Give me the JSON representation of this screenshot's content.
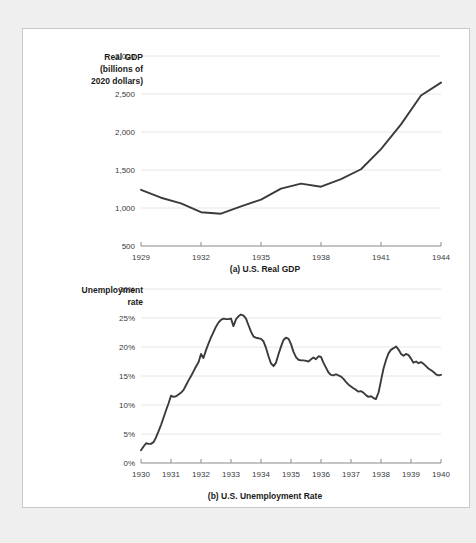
{
  "page": {
    "background_color": "#efefef",
    "panel_color": "#ffffff",
    "panel_border_color": "#c9c9c9"
  },
  "style": {
    "line_color": "#3b3b3b",
    "grid_color": "#e6e6e6",
    "axis_color": "#8a8a8a",
    "text_color": "#1a1a1a"
  },
  "chart_data": [
    {
      "type": "line",
      "id": "us-real-gdp",
      "title": "(a) U.S. Real GDP",
      "ylabel": "Real GDP (billions of 2020 dollars)",
      "ylabel_lines": [
        "Real GDP",
        "(billions of",
        "2020 dollars)"
      ],
      "xlabel": "",
      "grid": true,
      "legend": "none",
      "xlim": [
        1929,
        1944
      ],
      "ylim": [
        500,
        3000
      ],
      "xticks": [
        1929,
        1932,
        1935,
        1938,
        1941,
        1944
      ],
      "xtick_labels": [
        "1929",
        "1932",
        "1935",
        "1938",
        "1941",
        "1944"
      ],
      "yticks": [
        500,
        1000,
        1500,
        2000,
        2500,
        3000
      ],
      "ytick_labels": [
        "500",
        "1,000",
        "1,500",
        "2,000",
        "2,500",
        "3,000"
      ],
      "series": [
        {
          "name": "Real GDP",
          "x": [
            1929,
            1930,
            1931,
            1932,
            1933,
            1934,
            1935,
            1936,
            1937,
            1938,
            1939,
            1940,
            1941,
            1942,
            1943,
            1944
          ],
          "values": [
            1240,
            1135,
            1060,
            945,
            925,
            1020,
            1110,
            1255,
            1320,
            1280,
            1380,
            1510,
            1775,
            2100,
            2480,
            2650
          ]
        }
      ]
    },
    {
      "type": "line",
      "id": "us-unemployment-rate",
      "title": "(b) U.S. Unemployment Rate",
      "ylabel": "Unemployment rate",
      "ylabel_lines": [
        "Unemployment",
        "rate"
      ],
      "xlabel": "",
      "grid": true,
      "legend": "none",
      "xlim": [
        1930,
        1940
      ],
      "ylim": [
        0,
        30
      ],
      "xticks": [
        1930,
        1931,
        1932,
        1933,
        1934,
        1935,
        1936,
        1937,
        1938,
        1939,
        1940
      ],
      "xtick_labels": [
        "1930",
        "1931",
        "1932",
        "1933",
        "1934",
        "1935",
        "1936",
        "1937",
        "1938",
        "1939",
        "1940"
      ],
      "yticks": [
        0,
        5,
        10,
        15,
        20,
        25,
        30
      ],
      "ytick_labels": [
        "0%",
        "5%",
        "10%",
        "15%",
        "20%",
        "25%",
        "30%"
      ],
      "series": [
        {
          "name": "Unemployment rate",
          "x": [
            1930.0,
            1930.08,
            1930.17,
            1930.25,
            1930.33,
            1930.42,
            1930.5,
            1930.58,
            1930.67,
            1930.75,
            1930.83,
            1930.92,
            1931.0,
            1931.08,
            1931.17,
            1931.25,
            1931.33,
            1931.42,
            1931.5,
            1931.58,
            1931.67,
            1931.75,
            1931.83,
            1931.92,
            1932.0,
            1932.08,
            1932.17,
            1932.25,
            1932.33,
            1932.42,
            1932.5,
            1932.58,
            1932.67,
            1932.75,
            1932.83,
            1932.92,
            1933.0,
            1933.08,
            1933.17,
            1933.25,
            1933.33,
            1933.42,
            1933.5,
            1933.58,
            1933.67,
            1933.75,
            1933.83,
            1933.92,
            1934.0,
            1934.08,
            1934.17,
            1934.25,
            1934.33,
            1934.42,
            1934.5,
            1934.58,
            1934.67,
            1934.75,
            1934.83,
            1934.92,
            1935.0,
            1935.08,
            1935.17,
            1935.25,
            1935.33,
            1935.42,
            1935.5,
            1935.58,
            1935.67,
            1935.75,
            1935.83,
            1935.92,
            1936.0,
            1936.08,
            1936.17,
            1936.25,
            1936.33,
            1936.42,
            1936.5,
            1936.58,
            1936.67,
            1936.75,
            1936.83,
            1936.92,
            1937.0,
            1937.08,
            1937.17,
            1937.25,
            1937.33,
            1937.42,
            1937.5,
            1937.58,
            1937.67,
            1937.75,
            1937.83,
            1937.92,
            1938.0,
            1938.08,
            1938.17,
            1938.25,
            1938.33,
            1938.42,
            1938.5,
            1938.58,
            1938.67,
            1938.75,
            1938.83,
            1938.92,
            1939.0,
            1939.08,
            1939.17,
            1939.25,
            1939.33,
            1939.42,
            1939.5,
            1939.58,
            1939.67,
            1939.75,
            1939.83,
            1939.92,
            1940.0
          ],
          "values": [
            2.2,
            2.8,
            3.4,
            3.3,
            3.3,
            3.6,
            4.4,
            5.4,
            6.6,
            7.8,
            9.0,
            10.3,
            11.6,
            11.4,
            11.5,
            11.8,
            12.1,
            12.6,
            13.4,
            14.2,
            15.0,
            15.8,
            16.6,
            17.4,
            18.8,
            18.1,
            19.5,
            20.6,
            21.6,
            22.6,
            23.5,
            24.2,
            24.7,
            24.9,
            24.8,
            24.8,
            24.9,
            23.6,
            24.8,
            25.3,
            25.6,
            25.4,
            24.9,
            23.8,
            22.6,
            21.8,
            21.6,
            21.5,
            21.4,
            21.0,
            19.8,
            18.4,
            17.2,
            16.7,
            17.3,
            18.7,
            20.1,
            21.2,
            21.6,
            21.4,
            20.5,
            19.2,
            18.2,
            17.8,
            17.7,
            17.7,
            17.6,
            17.5,
            17.9,
            18.2,
            17.9,
            18.4,
            18.3,
            17.3,
            16.4,
            15.6,
            15.2,
            15.1,
            15.3,
            15.1,
            14.9,
            14.5,
            14.0,
            13.5,
            13.2,
            12.9,
            12.6,
            12.3,
            12.4,
            12.1,
            11.7,
            11.4,
            11.5,
            11.2,
            11.0,
            12.2,
            14.2,
            16.2,
            17.8,
            18.9,
            19.5,
            19.8,
            20.1,
            19.6,
            18.8,
            18.5,
            18.8,
            18.6,
            18.0,
            17.3,
            17.5,
            17.2,
            17.4,
            17.1,
            16.7,
            16.3,
            16.0,
            15.7,
            15.3,
            15.1,
            15.2
          ]
        }
      ]
    }
  ]
}
